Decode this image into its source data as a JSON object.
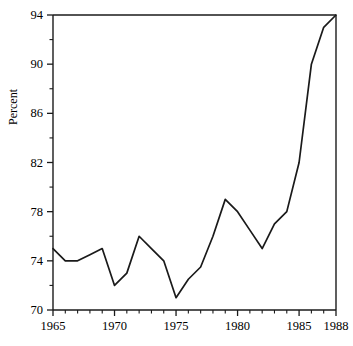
{
  "chart_data": {
    "type": "line",
    "title": "",
    "subtitle": "",
    "xlabel": "",
    "ylabel": "Percent",
    "xlim": [
      1965,
      1988
    ],
    "ylim": [
      70,
      94
    ],
    "grid": false,
    "legend": "none",
    "x": [
      1965,
      1966,
      1967,
      1968,
      1969,
      1970,
      1971,
      1972,
      1973,
      1974,
      1975,
      1976,
      1977,
      1978,
      1979,
      1980,
      1981,
      1982,
      1983,
      1984,
      1985,
      1986,
      1987,
      1988
    ],
    "values": [
      75.0,
      74.0,
      74.0,
      74.5,
      75.0,
      72.0,
      73.0,
      76.0,
      75.0,
      74.0,
      71.0,
      72.5,
      73.5,
      76.0,
      79.0,
      78.0,
      76.5,
      75.0,
      77.0,
      78.0,
      82.0,
      90.0,
      93.0,
      94.0
    ],
    "series": [
      {
        "name": "Percent",
        "color": "#1a1a1a",
        "values": [
          75.0,
          74.0,
          74.0,
          74.5,
          75.0,
          72.0,
          73.0,
          76.0,
          75.0,
          74.0,
          71.0,
          72.5,
          73.5,
          76.0,
          79.0,
          78.0,
          76.5,
          75.0,
          77.0,
          78.0,
          82.0,
          90.0,
          93.0,
          94.0
        ]
      }
    ],
    "y_major_ticks": [
      70,
      74,
      78,
      82,
      86,
      90,
      94
    ],
    "y_tick_labels": [
      "70",
      "74",
      "78",
      "82",
      "86",
      "90",
      "94"
    ],
    "y_minor_tick_step": 2,
    "x_major_ticks": [
      1965,
      1970,
      1975,
      1980,
      1985,
      1988
    ],
    "x_tick_labels": [
      "1965",
      "1970",
      "1975",
      "1980",
      "1985",
      "1988"
    ],
    "x_minor_tick_step": 1,
    "axis_color": "#1a1a1a",
    "background_color": "#ffffff"
  },
  "axes": {
    "y_axis_title": "Percent"
  }
}
